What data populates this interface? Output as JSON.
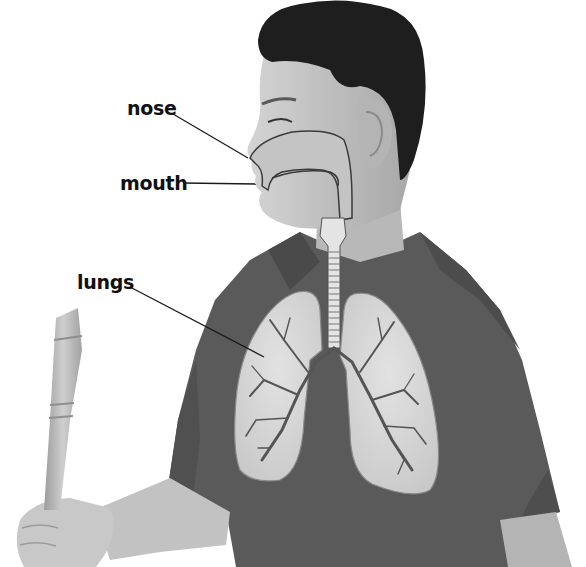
{
  "diagram": {
    "labels": [
      {
        "id": "nose",
        "text": "nose",
        "x": 127,
        "y": 99,
        "line": [
          173,
          114,
          248,
          158
        ]
      },
      {
        "id": "mouth",
        "text": "mouth",
        "x": 120,
        "y": 174,
        "line": [
          183,
          183,
          256,
          184
        ]
      },
      {
        "id": "lungs",
        "text": "lungs",
        "x": 77,
        "y": 273,
        "line": [
          130,
          287,
          264,
          357
        ]
      }
    ],
    "colors": {
      "background": "#ffffff",
      "label_text": "#111111",
      "leader_line": "#1a1a1a",
      "shirt": "#5a5a5a",
      "shirt_dark": "#484848",
      "skin": "#c9c9c9",
      "skin_shadow": "#a9a9a9",
      "hair": "#1e1e1e",
      "lung_fill": "#d8d8d8",
      "lung_outline": "#8a8a8a",
      "airway_fill": "#e6e6e6",
      "airway_outline": "#555555",
      "recorder": "#b8b8b8"
    }
  }
}
